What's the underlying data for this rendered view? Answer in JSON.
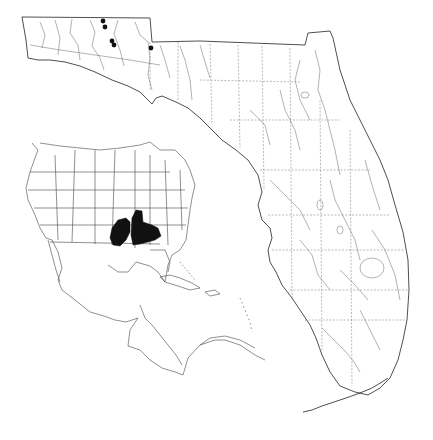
{
  "map": {
    "title": "",
    "subject": "species distribution map",
    "colors": {
      "background": "#ffffff",
      "lines": "#222222",
      "occurrence": "#111111"
    },
    "main_map": {
      "region": "Florida",
      "features": [
        "county boundaries",
        "rivers and streams",
        "lakes",
        "coastline",
        "Florida Keys"
      ]
    },
    "occurrence_points": [
      {
        "x": 103,
        "y": 21
      },
      {
        "x": 105,
        "y": 27
      },
      {
        "x": 112,
        "y": 41
      },
      {
        "x": 114,
        "y": 45
      },
      {
        "x": 151,
        "y": 48
      }
    ],
    "inset_map": {
      "region": "North America and Caribbean",
      "features": [
        "US state boundaries",
        "Mexico",
        "Central America",
        "Caribbean islands"
      ],
      "shaded_range": "Lower Mississippi Valley to Alabama / Florida panhandle"
    }
  }
}
